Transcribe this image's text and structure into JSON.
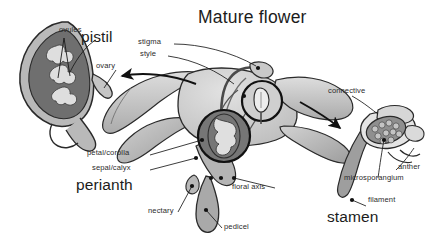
{
  "figure": {
    "title": "Mature flower",
    "palette": {
      "background": "#ffffff",
      "ink": "#1a1a1a",
      "tissue_light": "#d8d8d8",
      "tissue_mid": "#b0b0b0",
      "tissue_dark": "#8a8a8a",
      "ovary_dark": "#6f6f6f",
      "ovule_light": "#dcdcdc"
    }
  },
  "insets": {
    "pistil": {
      "heading": "pistil",
      "labels": {
        "ovules": "ovules",
        "ovary": "ovary"
      }
    },
    "stamen": {
      "heading": "stamen",
      "labels": {
        "connective": "connective",
        "anther": "anther",
        "microsporangium": "microsporangium",
        "filament": "filament"
      }
    }
  },
  "flower_labels": {
    "stigma": "stigma",
    "style": "style",
    "petal_corolla": "petal/corolla",
    "sepal_calyx": "sepal/calyx",
    "perianth": "perianth",
    "floral_axis": "floral axis",
    "nectary": "nectary",
    "pedicel": "pedicel"
  }
}
